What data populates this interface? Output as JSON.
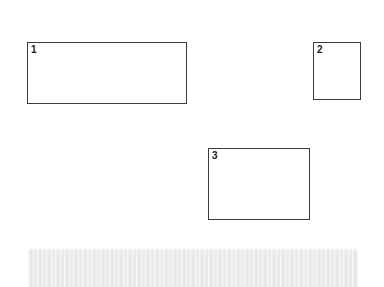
{
  "canvas": {
    "width": 384,
    "height": 287,
    "background_color": "#ffffff"
  },
  "regions": [
    {
      "label": "1",
      "name": "region-box-1",
      "x": 27,
      "y": 42,
      "width": 160,
      "height": 62,
      "border_color": "#3c3c3c",
      "fill_color": "#ffffff"
    },
    {
      "label": "2",
      "name": "region-box-2",
      "x": 313,
      "y": 42,
      "width": 48,
      "height": 58,
      "border_color": "#3c3c3c",
      "fill_color": "#ffffff"
    },
    {
      "label": "3",
      "name": "region-box-3",
      "x": 208,
      "y": 148,
      "width": 102,
      "height": 72,
      "border_color": "#3c3c3c",
      "fill_color": "#ffffff"
    }
  ],
  "redacted_band": {
    "name": "redacted-text-band",
    "x": 28,
    "y": 248,
    "width": 330,
    "height": 39,
    "color": "#ececec"
  }
}
